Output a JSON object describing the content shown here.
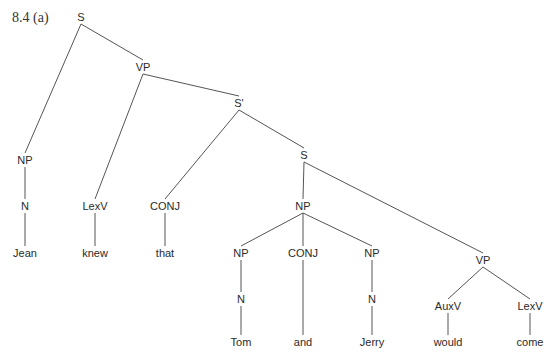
{
  "caption": "8.4 (a)",
  "tree": {
    "nodes": [
      {
        "id": "s_root",
        "label": "S",
        "x": 81,
        "y": 17
      },
      {
        "id": "np_jean",
        "label": "NP",
        "x": 25,
        "y": 160
      },
      {
        "id": "n_jean",
        "label": "N",
        "x": 25,
        "y": 206
      },
      {
        "id": "w_jean",
        "label": "Jean",
        "x": 25,
        "y": 253
      },
      {
        "id": "vp_main",
        "label": "VP",
        "x": 143,
        "y": 67
      },
      {
        "id": "lexv_knew",
        "label": "LexV",
        "x": 95,
        "y": 206
      },
      {
        "id": "w_knew",
        "label": "knew",
        "x": 95,
        "y": 253
      },
      {
        "id": "sbar",
        "label": "S'",
        "x": 239,
        "y": 103
      },
      {
        "id": "conj_that",
        "label": "CONJ",
        "x": 165,
        "y": 206
      },
      {
        "id": "w_that",
        "label": "that",
        "x": 165,
        "y": 253
      },
      {
        "id": "s_emb",
        "label": "S",
        "x": 304,
        "y": 155
      },
      {
        "id": "np_coord",
        "label": "NP",
        "x": 303,
        "y": 206
      },
      {
        "id": "np_tom",
        "label": "NP",
        "x": 241,
        "y": 253
      },
      {
        "id": "n_tom",
        "label": "N",
        "x": 241,
        "y": 299
      },
      {
        "id": "w_tom",
        "label": "Tom",
        "x": 241,
        "y": 342
      },
      {
        "id": "conj_and",
        "label": "CONJ",
        "x": 303,
        "y": 253
      },
      {
        "id": "w_and",
        "label": "and",
        "x": 303,
        "y": 342
      },
      {
        "id": "np_jerry",
        "label": "NP",
        "x": 372,
        "y": 253
      },
      {
        "id": "n_jerry",
        "label": "N",
        "x": 372,
        "y": 299
      },
      {
        "id": "w_jerry",
        "label": "Jerry",
        "x": 372,
        "y": 342
      },
      {
        "id": "vp_emb",
        "label": "VP",
        "x": 483,
        "y": 260
      },
      {
        "id": "auxv",
        "label": "AuxV",
        "x": 448,
        "y": 306
      },
      {
        "id": "w_would",
        "label": "would",
        "x": 448,
        "y": 342
      },
      {
        "id": "lexv_come",
        "label": "LexV",
        "x": 530,
        "y": 306
      },
      {
        "id": "w_come",
        "label": "come",
        "x": 530,
        "y": 342
      }
    ],
    "edges": [
      [
        "s_root",
        "np_jean"
      ],
      [
        "s_root",
        "vp_main"
      ],
      [
        "np_jean",
        "n_jean"
      ],
      [
        "n_jean",
        "w_jean"
      ],
      [
        "vp_main",
        "lexv_knew"
      ],
      [
        "vp_main",
        "sbar"
      ],
      [
        "lexv_knew",
        "w_knew"
      ],
      [
        "sbar",
        "conj_that"
      ],
      [
        "sbar",
        "s_emb"
      ],
      [
        "conj_that",
        "w_that"
      ],
      [
        "s_emb",
        "np_coord"
      ],
      [
        "s_emb",
        "vp_emb"
      ],
      [
        "np_coord",
        "np_tom"
      ],
      [
        "np_coord",
        "conj_and"
      ],
      [
        "np_coord",
        "np_jerry"
      ],
      [
        "np_tom",
        "n_tom"
      ],
      [
        "n_tom",
        "w_tom"
      ],
      [
        "conj_and",
        "w_and"
      ],
      [
        "np_jerry",
        "n_jerry"
      ],
      [
        "n_jerry",
        "w_jerry"
      ],
      [
        "vp_emb",
        "auxv"
      ],
      [
        "vp_emb",
        "lexv_come"
      ],
      [
        "auxv",
        "w_would"
      ],
      [
        "lexv_come",
        "w_come"
      ]
    ],
    "sentence": [
      "Jean",
      "knew",
      "that",
      "Tom",
      "and",
      "Jerry",
      "would",
      "come"
    ]
  },
  "colors": {
    "line": "#555555",
    "text": "#2a2a2a",
    "background": "#ffffff"
  }
}
